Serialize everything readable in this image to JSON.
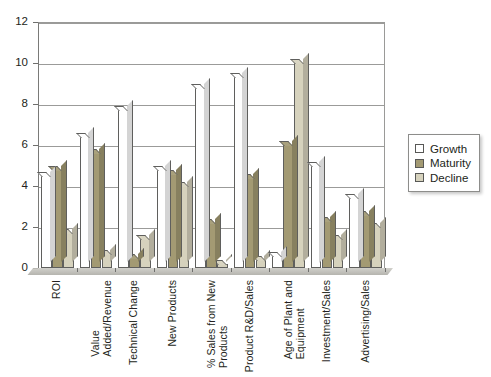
{
  "chart_data": {
    "type": "bar",
    "title": "",
    "xlabel": "",
    "ylabel": "",
    "ylim": [
      0,
      12
    ],
    "ytick_values": [
      0,
      2,
      4,
      6,
      8,
      10,
      12
    ],
    "ytick_labels": [
      "0",
      "2",
      "4",
      "6",
      "8",
      "10",
      "12"
    ],
    "grid": true,
    "legend_position": "right",
    "categories": [
      "ROI",
      "Value\nAdded/Revenue",
      "Technical Change",
      "New Products",
      "% Sales from New\nProducts",
      "Product R&D/Sales",
      "Age of Plant and\nEquipment",
      "Investment/Sales",
      "Advertising/Sales"
    ],
    "series": [
      {
        "name": "Growth",
        "color": "#ffffff",
        "values": [
          4.5,
          6.4,
          7.7,
          4.8,
          8.8,
          9.3,
          0.6,
          5.0,
          3.4
        ]
      },
      {
        "name": "Maturity",
        "color": "#a39a73",
        "values": [
          4.8,
          5.6,
          0.5,
          4.6,
          2.2,
          4.4,
          6.0,
          2.3,
          2.6
        ]
      },
      {
        "name": "Decline",
        "color": "#d6d2bd",
        "values": [
          1.7,
          0.7,
          1.4,
          4.0,
          0.2,
          0.4,
          10.0,
          1.4,
          2.0
        ]
      }
    ]
  },
  "legend": {
    "items": [
      {
        "label": "Growth",
        "color": "#ffffff"
      },
      {
        "label": "Maturity",
        "color": "#a39a73"
      },
      {
        "label": "Decline",
        "color": "#d6d2bd"
      }
    ]
  }
}
